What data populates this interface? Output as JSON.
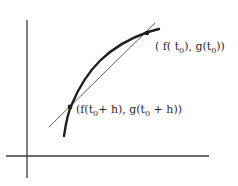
{
  "diagram": {
    "type": "secant-line-on-parametric-curve",
    "colors": {
      "background": "#ffffff",
      "axes": "#3a3a3a",
      "curve": "#1e1e1e",
      "secant": "#4a4a4a",
      "text": "#2a2a2a"
    },
    "axes": {
      "x_axis": {
        "x1": 6,
        "y1": 156,
        "x2": 209,
        "y2": 156
      },
      "y_axis": {
        "x1": 27,
        "y1": 20,
        "x2": 27,
        "y2": 178
      }
    },
    "curve": {
      "path": "M64,136 C66,122 68,112 72,104 C86,70 108,46 148,32 L159,29"
    },
    "secant": {
      "x1": 49,
      "y1": 127,
      "x2": 155,
      "y2": 23
    },
    "points": [
      {
        "id": "p0",
        "x": 147,
        "y": 33,
        "label_parts": {
          "open": "( f( t",
          "sub1": "0",
          "mid": "),  g(t",
          "sub2": "0",
          "close": "))"
        }
      },
      {
        "id": "p1",
        "x": 70,
        "y": 107,
        "label_parts": {
          "open": "(f(t",
          "sub1": "0",
          "mid": "+ h), g(t",
          "sub2": "0",
          "close": " + h))"
        }
      }
    ]
  }
}
